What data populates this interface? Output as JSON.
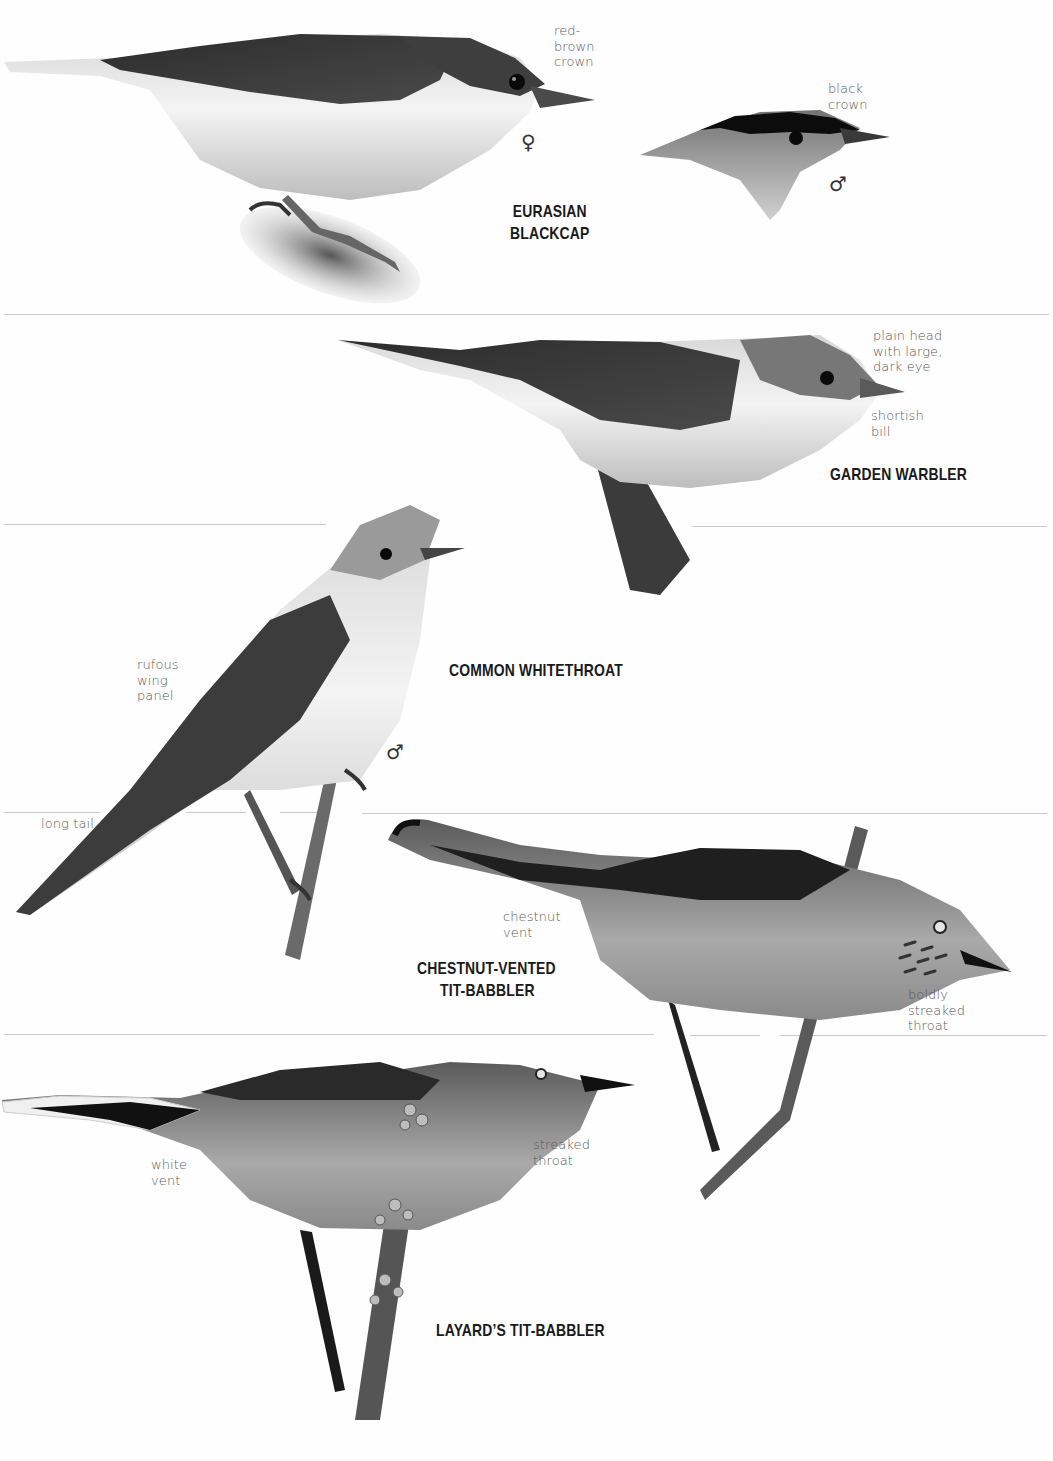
{
  "page": {
    "background": "#fefefe",
    "text_color_species": "#1a1a1a",
    "text_color_notes": "#5a5a5a",
    "divider_color": "#c9c9c9"
  },
  "species": [
    {
      "id": "eurasian-blackcap",
      "name_line1": "EURASIAN",
      "name_line2": "BLACKCAP",
      "annotations": {
        "female_crown": "red-\nbrown\ncrown",
        "male_crown": "black\ncrown"
      },
      "sex_symbols": {
        "female": "♀",
        "male": "♂"
      }
    },
    {
      "id": "garden-warbler",
      "name_line1": "GARDEN WARBLER",
      "annotations": {
        "head": "plain head\nwith large,\ndark eye",
        "bill": "shortish\nbill"
      }
    },
    {
      "id": "common-whitethroat",
      "name_line1": "COMMON WHITETHROAT",
      "annotations": {
        "wing": "rufous\nwing\npanel",
        "tail": "long tail"
      },
      "sex_symbols": {
        "male": "♂"
      }
    },
    {
      "id": "chestnut-vented-tit-babbler",
      "name_line1": "CHESTNUT-VENTED",
      "name_line2": "TIT-BABBLER",
      "annotations": {
        "vent": "chestnut\nvent",
        "throat": "boldly\nstreaked\nthroat"
      }
    },
    {
      "id": "layards-tit-babbler",
      "name_line1": "LAYARD’S TIT-BABBLER",
      "annotations": {
        "vent": "white\nvent",
        "throat": "streaked\nthroat"
      }
    }
  ]
}
